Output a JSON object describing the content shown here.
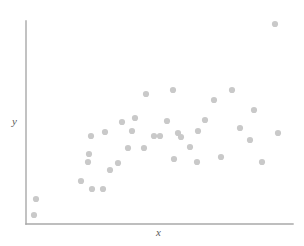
{
  "figure": {
    "width": 304,
    "height": 246,
    "background_color": "#ffffff"
  },
  "axes": {
    "line_color": "#a8a8a8",
    "line_width": 1.4,
    "y_axis": {
      "x": 26,
      "y_top": 21,
      "y_bottom": 224
    },
    "x_axis": {
      "y": 224,
      "x_left": 26,
      "x_right": 293
    }
  },
  "labels": {
    "y_axis_label": "y",
    "x_axis_label": "x",
    "label_color": "#5a5a5a"
  },
  "marker": {
    "color": "#c9c9c9",
    "radius": 3.1,
    "shape": "circle"
  },
  "chart_data": {
    "type": "scatter",
    "title": "",
    "xlabel": "x",
    "ylabel": "y",
    "grid": false,
    "legend": false,
    "xlim": [
      0,
      100
    ],
    "ylim": [
      0,
      100
    ],
    "axis_ticks": false,
    "series": [
      {
        "name": "observations",
        "color": "#c9c9c9",
        "n_points": 37,
        "points_px": [
          [
            36,
            199
          ],
          [
            34,
            215
          ],
          [
            81,
            181
          ],
          [
            92,
            189
          ],
          [
            103,
            189
          ],
          [
            89,
            154
          ],
          [
            88,
            162
          ],
          [
            91,
            136
          ],
          [
            105,
            132
          ],
          [
            118,
            163
          ],
          [
            122,
            122
          ],
          [
            128,
            148
          ],
          [
            132,
            131
          ],
          [
            144,
            148
          ],
          [
            146,
            94
          ],
          [
            154,
            136
          ],
          [
            174,
            159
          ],
          [
            173,
            90
          ],
          [
            178,
            133
          ],
          [
            181,
            137
          ],
          [
            198,
            131
          ],
          [
            197,
            162
          ],
          [
            214,
            100
          ],
          [
            221,
            157
          ],
          [
            232,
            90
          ],
          [
            254,
            110
          ],
          [
            262,
            162
          ],
          [
            275,
            24
          ],
          [
            278,
            133
          ],
          [
            110,
            170
          ],
          [
            160,
            136
          ],
          [
            190,
            147
          ],
          [
            205,
            120
          ],
          [
            240,
            128
          ],
          [
            135,
            118
          ],
          [
            167,
            121
          ],
          [
            250,
            140
          ]
        ],
        "points_data": [
          [
            3.7,
            12.3
          ],
          [
            3.0,
            4.4
          ],
          [
            20.6,
            21.2
          ],
          [
            24.7,
            17.2
          ],
          [
            28.8,
            17.2
          ],
          [
            23.6,
            34.5
          ],
          [
            23.2,
            30.5
          ],
          [
            24.3,
            43.3
          ],
          [
            29.6,
            45.3
          ],
          [
            34.5,
            29.6
          ],
          [
            36.0,
            50.2
          ],
          [
            38.2,
            37.4
          ],
          [
            39.7,
            45.8
          ],
          [
            44.2,
            37.4
          ],
          [
            45.0,
            64.0
          ],
          [
            48.0,
            43.3
          ],
          [
            55.4,
            32.0
          ],
          [
            55.1,
            66.0
          ],
          [
            57.0,
            44.8
          ],
          [
            58.1,
            42.9
          ],
          [
            64.4,
            46.8
          ],
          [
            64.0,
            30.5
          ],
          [
            70.4,
            61.1
          ],
          [
            73.0,
            33.0
          ],
          [
            77.2,
            66.0
          ],
          [
            85.4,
            56.2
          ],
          [
            88.4,
            30.5
          ],
          [
            93.3,
            98.5
          ],
          [
            94.4,
            44.8
          ],
          [
            31.5,
            26.6
          ],
          [
            50.2,
            42.9
          ],
          [
            61.4,
            37.9
          ],
          [
            67.0,
            51.2
          ],
          [
            80.1,
            47.3
          ],
          [
            40.8,
            54.2
          ],
          [
            52.8,
            52.2
          ],
          [
            83.9,
            41.4
          ]
        ]
      }
    ]
  }
}
